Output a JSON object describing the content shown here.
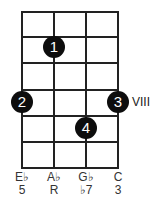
{
  "diagram": {
    "strings_x": [
      22,
      54,
      86,
      118
    ],
    "frets_y": [
      11,
      36,
      62,
      89,
      115,
      141,
      167
    ],
    "position_label": "VIII",
    "dots": [
      {
        "finger": "1",
        "string": 2,
        "x": 54,
        "y": 47
      },
      {
        "finger": "2",
        "string": 1,
        "x": 22,
        "y": 102
      },
      {
        "finger": "3",
        "string": 4,
        "x": 118,
        "y": 102
      },
      {
        "finger": "4",
        "string": 3,
        "x": 86,
        "y": 128
      }
    ],
    "notes": [
      "E♭",
      "A♭",
      "G♭",
      "C"
    ],
    "intervals": [
      "5",
      "R",
      "♭7",
      "3"
    ],
    "line_color": "#222222",
    "dot_color": "#0d0d0d"
  }
}
